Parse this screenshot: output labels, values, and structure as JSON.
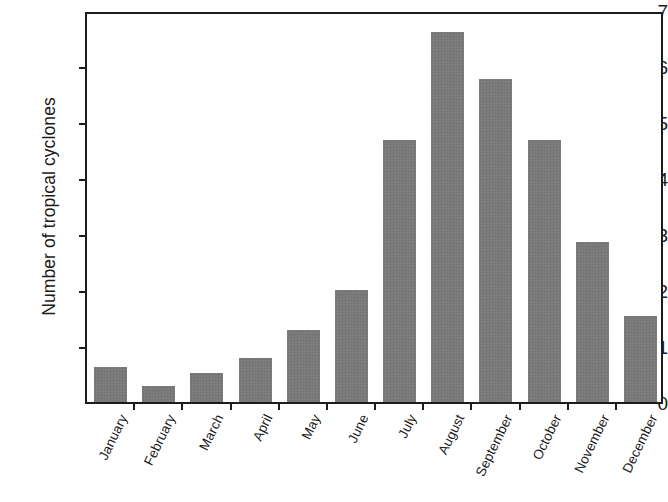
{
  "chart_data": {
    "type": "bar",
    "title": "",
    "xlabel": "",
    "ylabel": "Number of tropical cyclones",
    "categories": [
      "January",
      "February",
      "March",
      "April",
      "May",
      "June",
      "July",
      "August",
      "September",
      "October",
      "November",
      "December"
    ],
    "values": [
      0.62,
      0.28,
      0.52,
      0.78,
      1.28,
      2.0,
      4.68,
      6.6,
      5.77,
      4.67,
      2.85,
      1.53
    ],
    "ylim": [
      0,
      7
    ],
    "y_ticks": [
      0,
      1,
      2,
      3,
      4,
      5,
      6,
      7
    ],
    "y_tick_labels": [
      "0",
      "1",
      "2",
      "3",
      "4",
      "5",
      "6",
      "7"
    ],
    "grid": false,
    "legend": null,
    "legend_position": "none",
    "bar_color": "#787878",
    "axis_color": "#1c1c1c",
    "background_color": "#ffffff",
    "x_tick_label_rotation": -64,
    "series": [
      {
        "name": "Number of tropical cyclones",
        "values": [
          0.62,
          0.28,
          0.52,
          0.78,
          1.28,
          2.0,
          4.68,
          6.6,
          5.77,
          4.67,
          2.85,
          1.53
        ]
      }
    ]
  }
}
